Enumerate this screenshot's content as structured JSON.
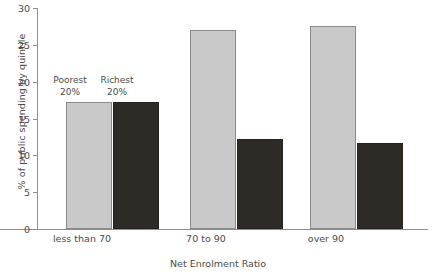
{
  "chart_data": {
    "type": "bar",
    "title": "",
    "subtitle": "",
    "xlabel": "Net Enrolment Ratio",
    "ylabel": "% of public spending by quintile",
    "categories": [
      "less than 70",
      "70 to 90",
      "over 90"
    ],
    "series": [
      {
        "name": "Poorest 20%",
        "color": "#c9c9c9",
        "values": [
          17.2,
          27.0,
          27.5
        ]
      },
      {
        "name": "Richest 20%",
        "color": "#2e2a26",
        "values": [
          17.3,
          12.2,
          11.7
        ]
      }
    ],
    "ylim": [
      0,
      30
    ],
    "yticks": [
      0,
      5,
      10,
      15,
      20,
      25,
      30
    ],
    "ytick_labels": [
      "0",
      "5",
      "10",
      "15",
      "20",
      "25",
      "30"
    ],
    "grid": false,
    "legend_position": "inline-above-first-group",
    "annotations": [
      {
        "text": "Poorest 20%",
        "target": "group-1-light-bar"
      },
      {
        "text": "Richest 20%",
        "target": "group-1-dark-bar"
      }
    ]
  }
}
